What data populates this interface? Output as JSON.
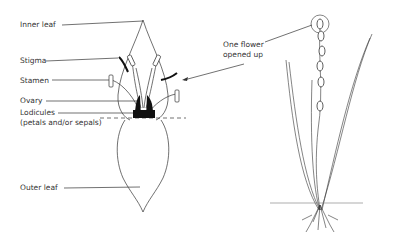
{
  "diagram": {
    "labels": {
      "inner_leaf": "Inner leaf",
      "stigma": "Stigma",
      "stamen": "Stamen",
      "ovary": "Ovary",
      "lodicules": "Lodicules",
      "lodicules_sub": "(petals and/or sepals)",
      "outer_leaf": "Outer leaf",
      "callout_line1": "One flower",
      "callout_line2": "opened up"
    },
    "colors": {
      "line": "#333333",
      "fill_dark": "#111111",
      "background": "#ffffff"
    }
  }
}
